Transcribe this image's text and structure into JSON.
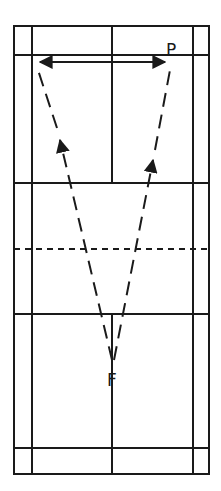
{
  "diagram": {
    "type": "badminton-court-shot-diagram",
    "colors": {
      "line": "#1a1a1a",
      "background": "#ffffff"
    },
    "court": {
      "outer": {
        "x": 14,
        "y": 26,
        "width": 195,
        "height": 448
      },
      "singles_sidelines_x": [
        32,
        193
      ],
      "center_line_x": 112,
      "back_service_lines_y": [
        55,
        448
      ],
      "short_service_lines_y": [
        183,
        314
      ],
      "net_y": 249,
      "net_style": "dashed"
    },
    "labels": {
      "player_p": "P",
      "player_f": "F"
    },
    "arrows": [
      {
        "name": "lateral-movement",
        "from": [
          38,
          62
        ],
        "to": [
          167,
          62
        ],
        "style": "solid",
        "heads": "both"
      },
      {
        "name": "shot-to-left-rear",
        "from": [
          113,
          362
        ],
        "to": [
          38,
          70
        ],
        "style": "dashed",
        "heads": "mid",
        "arrow_at": [
          60,
          140
        ]
      },
      {
        "name": "shot-to-right-rear",
        "from": [
          113,
          362
        ],
        "to": [
          170,
          70
        ],
        "style": "dashed",
        "heads": "mid",
        "arrow_at": [
          152,
          160
        ]
      }
    ]
  }
}
